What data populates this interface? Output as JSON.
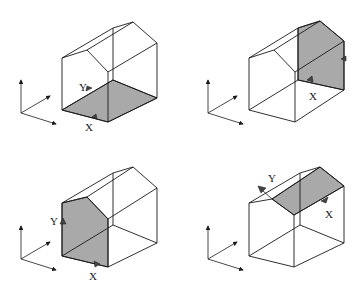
{
  "figure": {
    "colors": {
      "line": "#1a1a1a",
      "shade": "#a9a9a9",
      "background": "#ffffff"
    },
    "panels": [
      {
        "id": "top-left",
        "shaded_face": "floor",
        "labels": {
          "x": "X",
          "y": "Y"
        }
      },
      {
        "id": "top-right",
        "shaded_face": "back-gable-wall",
        "labels": {
          "x": "X"
        }
      },
      {
        "id": "bottom-left",
        "shaded_face": "front-gable-wall",
        "labels": {
          "x": "X",
          "y": "Y"
        }
      },
      {
        "id": "bottom-right",
        "shaded_face": "roof-slope",
        "labels": {
          "x": "X",
          "y": "Y"
        }
      }
    ]
  }
}
